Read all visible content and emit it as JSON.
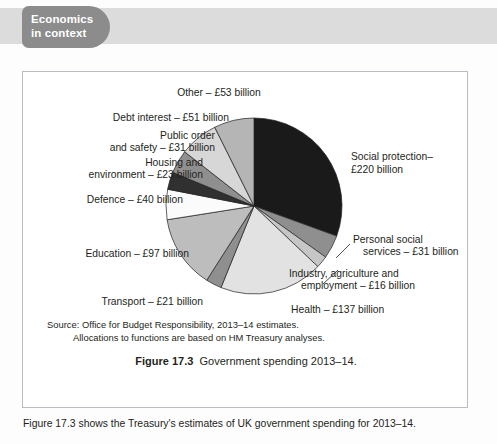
{
  "tab": {
    "line1": "Economics",
    "line2": "in context",
    "bg_color": "#8c8c8c",
    "text_color": "#ffffff"
  },
  "figure": {
    "caption_label": "Figure 17.3",
    "caption_text": "Government spending 2013–14.",
    "source_line1": "Source: Office for Budget Responsibility, 2013–14 estimates.",
    "source_line2": "Allocations to functions are based on HM Treasury analyses."
  },
  "body": {
    "sentence": "Figure 17.3 shows the Treasury's estimates of UK government spending for 2013–14."
  },
  "chart_data": {
    "type": "pie",
    "title": "Government spending 2013–14.",
    "unit": "£ billion",
    "total": 720,
    "start_angle_deg": 0,
    "direction": "clockwise",
    "legend": "labels-outside-with-leader-lines",
    "labels": [
      "Social protection– £220 billion",
      "Personal social services – £31 billion",
      "Industry, agriculture and employment – £16 billion",
      "Health – £137 billion",
      "Transport – £21 billion",
      "Education – £97 billion",
      "Defence – £40 billion",
      "Housing and environment – £23 billion",
      "Public order and safety – £31 billion",
      "Debt interest – £51 billion",
      "Other – £53 billion"
    ],
    "categories": [
      "Social protection",
      "Personal social services",
      "Industry, agriculture and employment",
      "Health",
      "Transport",
      "Education",
      "Defence",
      "Housing and environment",
      "Public order and safety",
      "Debt interest",
      "Other"
    ],
    "values": [
      220,
      31,
      16,
      137,
      21,
      97,
      40,
      23,
      31,
      51,
      53
    ],
    "colors": [
      "#1a1a1a",
      "#8f8f8f",
      "#c6c6c6",
      "#e2e2e2",
      "#8f8f8f",
      "#bdbdbd",
      "#fbfbfb",
      "#303030",
      "#8f8f8f",
      "#d7d7d7",
      "#b5b5b5"
    ]
  },
  "labels": {
    "other": {
      "text": "Other – £53 billion"
    },
    "debt_interest": {
      "text": "Debt interest – £51 billion"
    },
    "public_order_1": {
      "text": "Public order"
    },
    "public_order_2": {
      "text": "and safety – £31 billion"
    },
    "housing_1": {
      "text": "Housing and"
    },
    "housing_2": {
      "text": "environment – £23 billion"
    },
    "defence": {
      "text": "Defence – £40 billion"
    },
    "education": {
      "text": "Education – £97 billion"
    },
    "transport": {
      "text": "Transport – £21 billion"
    },
    "health": {
      "text": "Health – £137 billion"
    },
    "industry_1": {
      "text": "Industry, agriculture and"
    },
    "industry_2": {
      "text": "employment – £16 billion"
    },
    "pss_1": {
      "text": "Personal social"
    },
    "pss_2": {
      "text": "services – £31 billion"
    },
    "social_prot_1": {
      "text": "Social protection–"
    },
    "social_prot_2": {
      "text": "£220 billion"
    }
  }
}
